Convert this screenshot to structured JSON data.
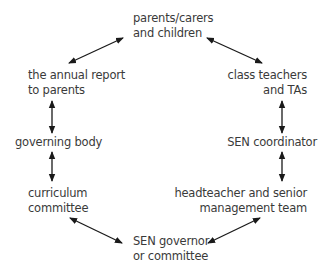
{
  "diagram": {
    "type": "cycle",
    "nodes": [
      {
        "id": "parents",
        "lines": [
          "parents/carers",
          "and children"
        ]
      },
      {
        "id": "class-teachers",
        "lines": [
          "class teachers",
          "and TAs"
        ]
      },
      {
        "id": "sen-coordinator",
        "lines": [
          "SEN coordinator"
        ]
      },
      {
        "id": "headteacher",
        "lines": [
          "headteacher and senior",
          "management team"
        ]
      },
      {
        "id": "sen-governor",
        "lines": [
          "SEN governor",
          "or committee"
        ]
      },
      {
        "id": "curriculum-committee",
        "lines": [
          "curriculum",
          "committee"
        ]
      },
      {
        "id": "governing-body",
        "lines": [
          "governing body"
        ]
      },
      {
        "id": "annual-report",
        "lines": [
          "the annual report",
          "to parents"
        ]
      }
    ],
    "edges": [
      {
        "from": "parents",
        "to": "class-teachers",
        "style": "double-arrow"
      },
      {
        "from": "class-teachers",
        "to": "sen-coordinator",
        "style": "double-arrow"
      },
      {
        "from": "sen-coordinator",
        "to": "headteacher",
        "style": "double-arrow"
      },
      {
        "from": "headteacher",
        "to": "sen-governor",
        "style": "double-arrow"
      },
      {
        "from": "sen-governor",
        "to": "curriculum-committee",
        "style": "double-arrow"
      },
      {
        "from": "curriculum-committee",
        "to": "governing-body",
        "style": "double-arrow"
      },
      {
        "from": "governing-body",
        "to": "annual-report",
        "style": "double-arrow"
      },
      {
        "from": "annual-report",
        "to": "parents",
        "style": "double-arrow"
      }
    ],
    "colors": {
      "text": "#3a3a3a",
      "arrow": "#1a1a1a",
      "background": "#ffffff"
    }
  }
}
